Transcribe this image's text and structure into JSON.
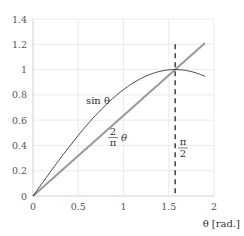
{
  "chart_data": {
    "type": "line",
    "title": "",
    "xlabel": "θ [rad.]",
    "ylabel": "",
    "xlim": [
      0,
      2
    ],
    "ylim": [
      0,
      1.4
    ],
    "grid": true,
    "legend": "none (inline labels)",
    "x_ticks": [
      "0",
      "0.5",
      "1",
      "1.5",
      "2"
    ],
    "y_ticks": [
      "0",
      "0.2",
      "0.4",
      "0.6",
      "0.8",
      "1",
      "1.2",
      "1.4"
    ],
    "series": [
      {
        "name": "sin θ",
        "label": "sin θ",
        "color": "#333333",
        "function": "sin(x)",
        "x_range": [
          0,
          1.9
        ]
      },
      {
        "name": "2/π θ",
        "label_num": "2",
        "label_den": "π",
        "label_var": "θ",
        "color": "#999999",
        "function": "2x/π",
        "x_range": [
          0,
          1.9
        ]
      }
    ],
    "annotations": [
      {
        "type": "vline",
        "x": 1.5708,
        "style": "dashed",
        "color": "#333333",
        "label_num": "π",
        "label_den": "2"
      }
    ]
  }
}
